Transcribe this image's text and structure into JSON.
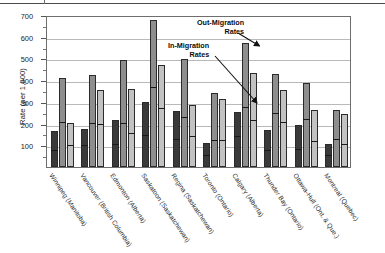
{
  "chart_data": {
    "type": "bar",
    "title": "",
    "xlabel": "",
    "ylabel": "Rate (per 1,000)",
    "ylim": [
      0,
      700
    ],
    "yticks": [
      100,
      200,
      300,
      400,
      500,
      600,
      700
    ],
    "grid": true,
    "legend_position": "none",
    "annotations": [
      {
        "text": "Out-Migration Rates",
        "target": "Calgary series-1 bar top"
      },
      {
        "text": "In-Migration Rates",
        "target": "Calgary series-1 inner marker"
      }
    ],
    "categories": [
      "Winnipeg (Manitoba)",
      "Vancouver (British Columbia)",
      "Edmonton (Alberta)",
      "Saskatoon (Saskatchewan)",
      "Regina (Saskatchewan)",
      "Toronto (Ontario)",
      "Calgary (Alberta)",
      "Thunder Bay (Ontario)",
      "Ottawa-Hull (Ont. & Que.)",
      "Montreal (Quebec)"
    ],
    "series": [
      {
        "name": "series-1-dark",
        "color": "#3a3a3a",
        "values": [
          165,
          177,
          218,
          299,
          258,
          110,
          253,
          171,
          195,
          104
        ],
        "markers": [
          68,
          92,
          95,
          138,
          118,
          47,
          135,
          70,
          72,
          44
        ]
      },
      {
        "name": "series-2-medium",
        "color": "#8e8e8e",
        "values": [
          410,
          423,
          492,
          676,
          498,
          342,
          572,
          428,
          386,
          261
        ],
        "markers": [
          198,
          193,
          194,
          360,
          221,
          117,
          267,
          240,
          211,
          119
        ]
      },
      {
        "name": "series-3-light",
        "color": "#c2c2c2",
        "values": [
          203,
          355,
          358,
          469,
          287,
          313,
          434,
          353,
          264,
          245
        ],
        "markers": [
          90,
          187,
          148,
          261,
          134,
          117,
          206,
          200,
          110,
          98
        ]
      }
    ]
  },
  "axis": {
    "y_title": "Rate (per 1,000)",
    "y_tick_labels": [
      "100",
      "200",
      "300",
      "400",
      "500",
      "600",
      "700"
    ]
  },
  "annotations": {
    "out_migration_line1": "Out-Migration",
    "out_migration_line2": "Rates",
    "in_migration_line1": "In-Migration",
    "in_migration_line2": "Rates"
  }
}
